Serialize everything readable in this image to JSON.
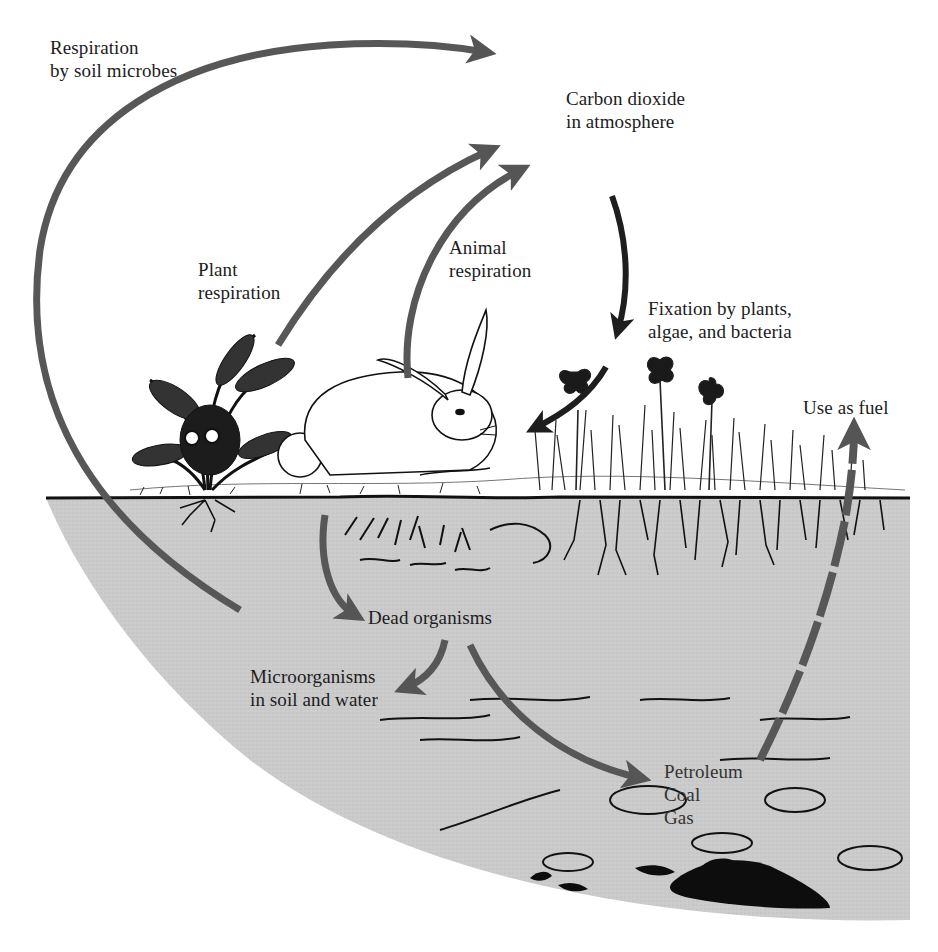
{
  "diagram": {
    "type": "carbon-cycle",
    "colors": {
      "background": "#ffffff",
      "soil": "#c9c9c9",
      "arrow_gray": "#5a5a5a",
      "arrow_dark": "#1e1e1e",
      "ink": "#111111"
    },
    "labels": {
      "soil_microbes": {
        "line1": "Respiration",
        "line2": "by soil microbes"
      },
      "co2": {
        "line1": "Carbon dioxide",
        "line2": "in atmosphere"
      },
      "plant_resp": {
        "line1": "Plant",
        "line2": "respiration"
      },
      "animal_resp": {
        "line1": "Animal",
        "line2": "respiration"
      },
      "fixation": {
        "line1": "Fixation by plants,",
        "line2": "algae, and bacteria"
      },
      "fuel": {
        "line1": "Use as fuel"
      },
      "dead": {
        "line1": "Dead organisms"
      },
      "micro": {
        "line1": "Microorganisms",
        "line2": "in soil and water"
      },
      "fossil": {
        "line1": "Petroleum",
        "line2": "Coal",
        "line3": "Gas"
      }
    },
    "illustrations": [
      "fern-plant",
      "rabbit",
      "grass-and-flowers",
      "plant-roots",
      "buried-organic-matter",
      "fossil-fuel-deposits"
    ],
    "flows": [
      {
        "from": "Microorganisms in soil and water",
        "to": "Carbon dioxide in atmosphere",
        "label": "Respiration by soil microbes"
      },
      {
        "from": "Plants",
        "to": "Carbon dioxide in atmosphere",
        "label": "Plant respiration"
      },
      {
        "from": "Animals",
        "to": "Carbon dioxide in atmosphere",
        "label": "Animal respiration"
      },
      {
        "from": "Carbon dioxide in atmosphere",
        "to": "Plants",
        "label": "Fixation by plants, algae, and bacteria"
      },
      {
        "from": "Plants/Animals",
        "to": "Dead organisms"
      },
      {
        "from": "Dead organisms",
        "to": "Microorganisms in soil and water"
      },
      {
        "from": "Dead organisms",
        "to": "Petroleum, Coal, Gas"
      },
      {
        "from": "Petroleum, Coal, Gas",
        "to": "Carbon dioxide in atmosphere",
        "label": "Use as fuel"
      }
    ]
  }
}
